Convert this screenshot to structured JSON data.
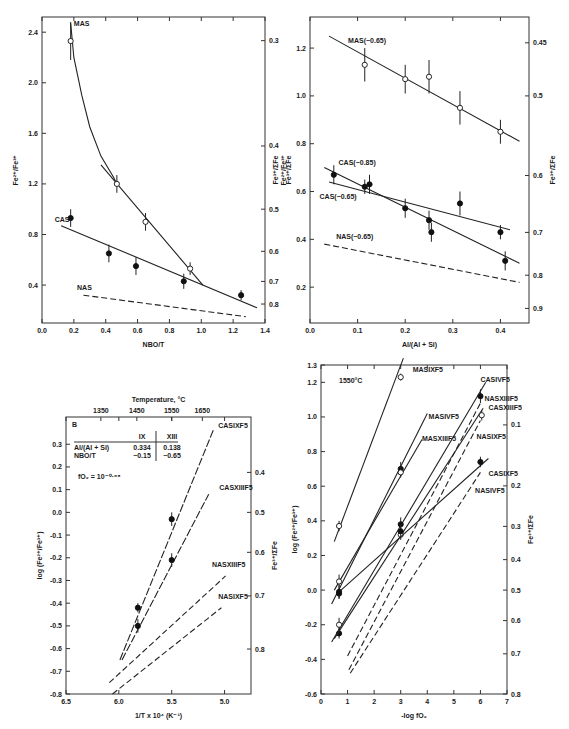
{
  "chart_data": [
    {
      "id": "panel-a",
      "type": "scatter",
      "frame": {
        "x0": 42,
        "x1": 265,
        "y0": 17,
        "y1": 323
      },
      "xlabel": "NBO/T",
      "ylabel": "Fe2+/Fe3+",
      "ylabel_right": "Fe3+/ΣFe",
      "xlim": [
        0.0,
        1.4
      ],
      "ylim": [
        0.1,
        2.52
      ],
      "xticks": [
        0.0,
        0.2,
        0.4,
        0.6,
        0.8,
        1.0,
        1.2,
        1.4
      ],
      "yticks": [
        0.4,
        0.8,
        1.2,
        1.6,
        2.0,
        2.4
      ],
      "yticks_right": [
        {
          "label": "0.3",
          "y": 2.333
        },
        {
          "label": "0.4",
          "y": 1.5
        },
        {
          "label": "0.5",
          "y": 1.0
        },
        {
          "label": "0.6",
          "y": 0.667
        },
        {
          "label": "0.7",
          "y": 0.429
        },
        {
          "label": "0.8",
          "y": 0.25
        }
      ],
      "series": [
        {
          "name": "MAS",
          "marker": "open",
          "points": [
            [
              0.18,
              2.33,
              0.15
            ],
            [
              0.47,
              1.2,
              0.07
            ],
            [
              0.65,
              0.9,
              0.07
            ],
            [
              0.93,
              0.53,
              0.05
            ]
          ],
          "curve": [
            [
              0.18,
              2.47
            ],
            [
              0.2,
              2.2
            ],
            [
              0.25,
              1.9
            ],
            [
              0.3,
              1.65
            ],
            [
              0.37,
              1.42
            ],
            [
              0.45,
              1.25
            ],
            [
              0.47,
              1.2
            ]
          ],
          "fit": [
            [
              0.37,
              1.35
            ],
            [
              1.01,
              0.4
            ]
          ],
          "label": {
            "text": "MAS",
            "x": 0.2,
            "y": 2.45
          }
        },
        {
          "name": "CAS",
          "marker": "filled",
          "points": [
            [
              0.18,
              0.93,
              0.07
            ],
            [
              0.42,
              0.65,
              0.07
            ],
            [
              0.59,
              0.55,
              0.07
            ],
            [
              0.89,
              0.43,
              0.06
            ],
            [
              1.25,
              0.32,
              0.04
            ]
          ],
          "fit": [
            [
              0.12,
              0.87
            ],
            [
              1.35,
              0.22
            ]
          ],
          "label": {
            "text": "CAS",
            "x": 0.08,
            "y": 0.9
          }
        },
        {
          "name": "NAS",
          "dashed": true,
          "fit": [
            [
              0.26,
              0.32
            ],
            [
              1.28,
              0.15
            ]
          ],
          "label": {
            "text": "NAS",
            "x": 0.22,
            "y": 0.36
          }
        }
      ]
    },
    {
      "id": "panel-b",
      "type": "scatter",
      "frame": {
        "x0": 310,
        "x1": 529,
        "y0": 17,
        "y1": 323
      },
      "xlabel": "Al/(Al + Si)",
      "ylabel": "Fe2+/Fe3+",
      "ylabel_left_extra": "Fe3+/ΣFe",
      "ylabel_right": "Fe3+/ΣFe",
      "xlim": [
        0.0,
        0.46
      ],
      "ylim": [
        0.05,
        1.33
      ],
      "xticks": [
        0.0,
        0.1,
        0.2,
        0.3,
        0.4
      ],
      "yticks": [
        0.2,
        0.4,
        0.6,
        0.8,
        1.0,
        1.2
      ],
      "yticks_right": [
        {
          "label": "0.45",
          "y": 1.222
        },
        {
          "label": "0.5",
          "y": 1.0
        },
        {
          "label": "0.6",
          "y": 0.667
        },
        {
          "label": "0.7",
          "y": 0.429
        },
        {
          "label": "0.8",
          "y": 0.25
        },
        {
          "label": "0.9",
          "y": 0.111
        }
      ],
      "series": [
        {
          "name": "MAS(~0.65)",
          "marker": "open",
          "points": [
            [
              0.115,
              1.13,
              0.07
            ],
            [
              0.2,
              1.07,
              0.06
            ],
            [
              0.25,
              1.08,
              0.07
            ],
            [
              0.315,
              0.95,
              0.07
            ],
            [
              0.4,
              0.85,
              0.05
            ]
          ],
          "fit": [
            [
              0.04,
              1.25
            ],
            [
              0.44,
              0.81
            ]
          ],
          "label": {
            "text": "MAS(~0.65)",
            "x": 0.08,
            "y": 1.22
          }
        },
        {
          "name": "CAS(~0.85)",
          "marker": "filled",
          "points": [
            [
              0.05,
              0.67,
              0.04
            ],
            [
              0.115,
              0.62,
              0.03
            ],
            [
              0.125,
              0.63,
              0.04
            ],
            [
              0.2,
              0.53,
              0.04
            ],
            [
              0.25,
              0.48,
              0.04
            ],
            [
              0.255,
              0.43,
              0.04
            ],
            [
              0.41,
              0.31,
              0.04
            ]
          ],
          "fit": [
            [
              0.03,
              0.7
            ],
            [
              0.44,
              0.3
            ]
          ],
          "label": {
            "text": "CAS(~0.85)",
            "x": 0.06,
            "y": 0.71
          }
        },
        {
          "name": "CAS(~0.65)",
          "marker": "filled",
          "points": [
            [
              0.315,
              0.55,
              0.05
            ],
            [
              0.4,
              0.43,
              0.03
            ]
          ],
          "fit": [
            [
              0.04,
              0.64
            ],
            [
              0.42,
              0.44
            ]
          ],
          "label": {
            "text": "CAS(~0.65)",
            "x": 0.02,
            "y": 0.57
          }
        },
        {
          "name": "NAS(~0.65)",
          "dashed": true,
          "fit": [
            [
              0.03,
              0.38
            ],
            [
              0.44,
              0.22
            ]
          ],
          "label": {
            "text": "NAS(~0.65)",
            "x": 0.055,
            "y": 0.4
          }
        }
      ]
    },
    {
      "id": "panel-c",
      "type": "scatter",
      "frame": {
        "x0": 66,
        "x1": 251,
        "y0": 417,
        "y1": 694
      },
      "xlabel": "1/T x 10^4 (K^-1)",
      "ylabel": "log (Fe2+/Fe3+)",
      "ylabel_right": "Fe3+/ΣFe",
      "top_axis_label": "Temperature, °C",
      "top_ticks": [
        {
          "label": "1350",
          "x": 6.17
        },
        {
          "label": "1450",
          "x": 5.83
        },
        {
          "label": "1550",
          "x": 5.5
        },
        {
          "label": "1650",
          "x": 5.21
        }
      ],
      "panel_letter": "B",
      "inset_table": {
        "headers": [
          "",
          "IX",
          "XIII"
        ],
        "rows": [
          [
            "Al/(Al + Si)",
            "0.334",
            "0.138"
          ],
          [
            "NBO/T",
            "~0.15",
            "~0.65"
          ]
        ]
      },
      "annotation": "fO2 = 10^-0.68",
      "xlim": [
        6.5,
        4.75
      ],
      "ylim": [
        -0.8,
        0.42
      ],
      "xticks": [
        6.5,
        6.0,
        5.5,
        5.0
      ],
      "yticks": [
        -0.8,
        -0.7,
        -0.6,
        -0.5,
        -0.4,
        -0.3,
        -0.2,
        -0.1,
        0.0,
        0.1,
        0.2,
        0.3
      ],
      "yticks_right": [
        {
          "label": "0.4",
          "y": 0.176
        },
        {
          "label": "0.5",
          "y": 0.0
        },
        {
          "label": "0.6",
          "y": -0.176
        },
        {
          "label": "0.7",
          "y": -0.368
        },
        {
          "label": "0.8",
          "y": -0.602
        }
      ],
      "series": [
        {
          "name": "CASIXF5",
          "marker": "filled",
          "points": [
            [
              5.82,
              -0.42,
              0.02
            ],
            [
              5.5,
              -0.03,
              0.03
            ]
          ],
          "fit": [
            [
              5.99,
              -0.65
            ],
            [
              5.1,
              0.37
            ]
          ],
          "dashed_ext": true,
          "label": {
            "text": "CASIXF5",
            "x": 5.06,
            "y": 0.37
          }
        },
        {
          "name": "CASXIIIF5",
          "marker": "filled",
          "points": [
            [
              5.82,
              -0.5,
              0.03
            ],
            [
              5.5,
              -0.21,
              0.03
            ]
          ],
          "fit": [
            [
              5.97,
              -0.65
            ],
            [
              5.15,
              0.08
            ]
          ],
          "dashed_ext": true,
          "label": {
            "text": "CASXIIIF5",
            "x": 5.05,
            "y": 0.1
          }
        },
        {
          "name": "NASXIIIF5",
          "dashed": true,
          "fit": [
            [
              6.09,
              -0.75
            ],
            [
              4.99,
              -0.28
            ]
          ],
          "label": {
            "text": "NASXIIIF5",
            "x": 5.12,
            "y": -0.24
          }
        },
        {
          "name": "NASIXF5",
          "dashed": true,
          "fit": [
            [
              6.06,
              -0.8
            ],
            [
              5.03,
              -0.42
            ]
          ],
          "label": {
            "text": "NASIXF5",
            "x": 5.06,
            "y": -0.38
          }
        }
      ]
    },
    {
      "id": "panel-d",
      "type": "scatter",
      "frame": {
        "x0": 321,
        "x1": 507,
        "y0": 365,
        "y1": 694
      },
      "xlabel": "-log fO2",
      "ylabel": "log (Fe2+/Fe3+)",
      "ylabel_right": "Fe3+/ΣFe",
      "annotation": "1550°C",
      "xlim": [
        0,
        7
      ],
      "ylim": [
        -0.6,
        1.3
      ],
      "xticks": [
        0,
        1,
        2,
        3,
        4,
        5,
        6,
        7
      ],
      "yticks": [
        -0.6,
        -0.4,
        -0.2,
        0.0,
        0.2,
        0.4,
        0.6,
        0.8,
        1.0,
        1.2,
        1.3
      ],
      "yticks_right": [
        {
          "label": "0.1",
          "y": 0.954
        },
        {
          "label": "0.2",
          "y": 0.602
        },
        {
          "label": "0.3",
          "y": 0.368
        },
        {
          "label": "0.4",
          "y": 0.176
        },
        {
          "label": "0.5",
          "y": 0.0
        },
        {
          "label": "0.6",
          "y": -0.176
        },
        {
          "label": "0.7",
          "y": -0.368
        },
        {
          "label": "0.8",
          "y": -0.6
        }
      ],
      "series": [
        {
          "name": "MASIXF5",
          "marker": "open",
          "points": [
            [
              0.68,
              0.37,
              0.03
            ],
            [
              3.0,
              1.23,
              0.02
            ]
          ],
          "fit": [
            [
              0.5,
              0.28
            ],
            [
              3.1,
              1.34
            ]
          ],
          "label": {
            "text": "MASIXF5",
            "x": 3.45,
            "y": 1.26
          }
        },
        {
          "name": "MASIVF5",
          "marker": "filled",
          "points": [
            [
              0.68,
              -0.02,
              0.03
            ],
            [
              3.0,
              0.7,
              0.04
            ]
          ],
          "fit": [
            [
              0.4,
              -0.08
            ],
            [
              4.0,
              1.02
            ]
          ],
          "label": {
            "text": "MASIVF5",
            "x": 4.05,
            "y": 0.99
          }
        },
        {
          "name": "MASXIIIF5",
          "marker": "open",
          "points": [
            [
              0.68,
              0.05,
              0.04
            ],
            [
              3.0,
              0.68,
              0.03
            ]
          ],
          "fit": [
            [
              0.5,
              0.0
            ],
            [
              3.8,
              0.87
            ]
          ],
          "label": {
            "text": "MASXIIIF5",
            "x": 3.8,
            "y": 0.86
          }
        },
        {
          "name": "CASIVF5",
          "marker": "filled",
          "points": [
            [
              0.68,
              -0.25,
              0.03
            ],
            [
              3.0,
              0.38,
              0.04
            ],
            [
              6.0,
              1.12,
              0.04
            ]
          ],
          "fit": [
            [
              0.4,
              -0.3
            ],
            [
              6.2,
              1.2
            ]
          ],
          "label": {
            "text": "CASIVF5",
            "x": 6.0,
            "y": 1.2
          }
        },
        {
          "name": "CASXIIIF5",
          "marker": "open",
          "points": [
            [
              0.68,
              -0.2,
              0.04
            ],
            [
              3.0,
              0.32,
              0.03
            ],
            [
              6.05,
              1.01,
              0.03
            ]
          ],
          "fit": [
            [
              0.5,
              -0.28
            ],
            [
              6.1,
              1.05
            ]
          ],
          "label": {
            "text": "CASXIIIF5",
            "x": 6.3,
            "y": 1.04
          }
        },
        {
          "name": "CASIXF5",
          "marker": "filled",
          "points": [
            [
              0.68,
              -0.01,
              0.04
            ],
            [
              3.0,
              0.34,
              0.04
            ],
            [
              6.0,
              0.74,
              0.03
            ]
          ],
          "fit": [
            [
              0.68,
              -0.01
            ],
            [
              6.3,
              0.76
            ]
          ],
          "label": {
            "text": "CASIXF5",
            "x": 6.3,
            "y": 0.66
          }
        },
        {
          "name": "NASXIIIF5",
          "dashed": true,
          "fit": [
            [
              1.0,
              -0.38
            ],
            [
              6.0,
              1.08
            ]
          ],
          "label": {
            "text": "NASXIIIF5",
            "x": 6.15,
            "y": 1.09
          }
        },
        {
          "name": "NASIXF5",
          "dashed": true,
          "fit": [
            [
              1.05,
              -0.46
            ],
            [
              6.0,
              0.98
            ]
          ],
          "label": {
            "text": "NASIXF5",
            "x": 5.85,
            "y": 0.87
          }
        },
        {
          "name": "NASIVF5",
          "dashed": true,
          "fit": [
            [
              1.1,
              -0.48
            ],
            [
              6.0,
              0.68
            ]
          ],
          "label": {
            "text": "NASIVF5",
            "x": 5.8,
            "y": 0.56
          }
        }
      ]
    }
  ]
}
